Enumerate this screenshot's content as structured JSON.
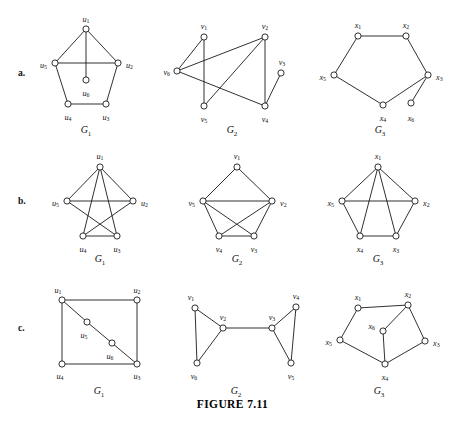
{
  "figure": {
    "caption": "FIGURE 7.11",
    "width": 465,
    "height": 421,
    "background": "#ffffff",
    "ink_color": "#1a1a1a"
  },
  "rows": [
    {
      "label": "a.",
      "label_x": 18,
      "label_y": 68
    },
    {
      "label": "b.",
      "label_x": 18,
      "label_y": 196
    },
    {
      "label": "c.",
      "label_x": 18,
      "label_y": 323
    }
  ],
  "graphs": [
    {
      "id": "a-G1",
      "row": "a.",
      "name": "G",
      "name_sub": "1",
      "name_x": 86,
      "name_y": 133,
      "vertex_radius": 3.1,
      "vertices": [
        {
          "id": "u1",
          "sym": "u",
          "sub": "1",
          "x": 86,
          "y": 29,
          "lx": 86,
          "ly": 20,
          "anchor": "middle"
        },
        {
          "id": "u2",
          "sym": "u",
          "sub": "2",
          "x": 118,
          "y": 63,
          "lx": 126,
          "ly": 66,
          "anchor": "start"
        },
        {
          "id": "u3",
          "sym": "u",
          "sub": "3",
          "x": 106,
          "y": 104,
          "lx": 106,
          "ly": 118,
          "anchor": "middle"
        },
        {
          "id": "u4",
          "sym": "u",
          "sub": "4",
          "x": 68,
          "y": 104,
          "lx": 68,
          "ly": 118,
          "anchor": "middle"
        },
        {
          "id": "u5",
          "sym": "u",
          "sub": "5",
          "x": 55,
          "y": 63,
          "lx": 47,
          "ly": 66,
          "anchor": "end"
        },
        {
          "id": "u6",
          "sym": "u",
          "sub": "6",
          "x": 86,
          "y": 80,
          "lx": 86,
          "ly": 94,
          "anchor": "middle"
        }
      ],
      "edges": [
        [
          "u1",
          "u2"
        ],
        [
          "u2",
          "u3"
        ],
        [
          "u3",
          "u4"
        ],
        [
          "u4",
          "u5"
        ],
        [
          "u5",
          "u1"
        ],
        [
          "u5",
          "u2"
        ],
        [
          "u1",
          "u6"
        ]
      ]
    },
    {
      "id": "a-G2",
      "row": "a.",
      "name": "G",
      "name_sub": "2",
      "name_x": 232,
      "name_y": 133,
      "vertex_radius": 3.1,
      "vertices": [
        {
          "id": "v1",
          "sym": "v",
          "sub": "1",
          "x": 204,
          "y": 37,
          "lx": 204,
          "ly": 27,
          "anchor": "middle"
        },
        {
          "id": "v2",
          "sym": "v",
          "sub": "2",
          "x": 265,
          "y": 37,
          "lx": 265,
          "ly": 27,
          "anchor": "middle"
        },
        {
          "id": "v3",
          "sym": "v",
          "sub": "3",
          "x": 281,
          "y": 73,
          "lx": 282,
          "ly": 63,
          "anchor": "middle"
        },
        {
          "id": "v4",
          "sym": "v",
          "sub": "4",
          "x": 265,
          "y": 106,
          "lx": 265,
          "ly": 120,
          "anchor": "middle"
        },
        {
          "id": "v5",
          "sym": "v",
          "sub": "5",
          "x": 204,
          "y": 106,
          "lx": 204,
          "ly": 120,
          "anchor": "middle"
        },
        {
          "id": "v6",
          "sym": "v",
          "sub": "6",
          "x": 177,
          "y": 71,
          "lx": 170,
          "ly": 73,
          "anchor": "end"
        }
      ],
      "edges": [
        [
          "v6",
          "v1"
        ],
        [
          "v6",
          "v2"
        ],
        [
          "v6",
          "v4"
        ],
        [
          "v1",
          "v5"
        ],
        [
          "v2",
          "v5"
        ],
        [
          "v2",
          "v4"
        ],
        [
          "v3",
          "v4"
        ]
      ]
    },
    {
      "id": "a-G3",
      "row": "a.",
      "name": "G",
      "name_sub": "3",
      "name_x": 380,
      "name_y": 133,
      "vertex_radius": 3.1,
      "vertices": [
        {
          "id": "x1",
          "sym": "x",
          "sub": "1",
          "x": 358,
          "y": 36,
          "lx": 358,
          "ly": 26,
          "anchor": "middle"
        },
        {
          "id": "x2",
          "sym": "x",
          "sub": "2",
          "x": 406,
          "y": 36,
          "lx": 406,
          "ly": 26,
          "anchor": "middle"
        },
        {
          "id": "x3",
          "sym": "x",
          "sub": "3",
          "x": 428,
          "y": 75,
          "lx": 436,
          "ly": 78,
          "anchor": "start"
        },
        {
          "id": "x4",
          "sym": "x",
          "sub": "4",
          "x": 383,
          "y": 105,
          "lx": 383,
          "ly": 119,
          "anchor": "middle"
        },
        {
          "id": "x5",
          "sym": "x",
          "sub": "5",
          "x": 334,
          "y": 75,
          "lx": 326,
          "ly": 78,
          "anchor": "end"
        },
        {
          "id": "x6",
          "sym": "x",
          "sub": "6",
          "x": 411,
          "y": 103,
          "lx": 411,
          "ly": 119,
          "anchor": "middle"
        }
      ],
      "edges": [
        [
          "x1",
          "x2"
        ],
        [
          "x2",
          "x3"
        ],
        [
          "x3",
          "x4"
        ],
        [
          "x4",
          "x5"
        ],
        [
          "x5",
          "x1"
        ],
        [
          "x3",
          "x6"
        ]
      ]
    },
    {
      "id": "b-G1",
      "row": "b.",
      "name": "G",
      "name_sub": "1",
      "name_x": 100,
      "name_y": 262,
      "vertex_radius": 3.1,
      "vertices": [
        {
          "id": "u1",
          "sym": "u",
          "sub": "1",
          "x": 100,
          "y": 167,
          "lx": 100,
          "ly": 157,
          "anchor": "middle"
        },
        {
          "id": "u2",
          "sym": "u",
          "sub": "2",
          "x": 133,
          "y": 201,
          "lx": 141,
          "ly": 204,
          "anchor": "start"
        },
        {
          "id": "u3",
          "sym": "u",
          "sub": "3",
          "x": 117,
          "y": 236,
          "lx": 117,
          "ly": 250,
          "anchor": "middle"
        },
        {
          "id": "u4",
          "sym": "u",
          "sub": "4",
          "x": 83,
          "y": 236,
          "lx": 83,
          "ly": 250,
          "anchor": "middle"
        },
        {
          "id": "u5",
          "sym": "u",
          "sub": "5",
          "x": 67,
          "y": 201,
          "lx": 59,
          "ly": 204,
          "anchor": "end"
        }
      ],
      "edges": [
        [
          "u1",
          "u5"
        ],
        [
          "u1",
          "u2"
        ],
        [
          "u1",
          "u4"
        ],
        [
          "u1",
          "u3"
        ],
        [
          "u5",
          "u2"
        ],
        [
          "u5",
          "u3"
        ],
        [
          "u2",
          "u4"
        ],
        [
          "u4",
          "u3"
        ]
      ]
    },
    {
      "id": "b-G2",
      "row": "b.",
      "name": "G",
      "name_sub": "2",
      "name_x": 237,
      "name_y": 262,
      "vertex_radius": 3.1,
      "vertices": [
        {
          "id": "v1",
          "sym": "v",
          "sub": "1",
          "x": 237,
          "y": 167,
          "lx": 237,
          "ly": 157,
          "anchor": "middle"
        },
        {
          "id": "v2",
          "sym": "v",
          "sub": "2",
          "x": 272,
          "y": 201,
          "lx": 280,
          "ly": 204,
          "anchor": "start"
        },
        {
          "id": "v3",
          "sym": "v",
          "sub": "3",
          "x": 254,
          "y": 236,
          "lx": 254,
          "ly": 250,
          "anchor": "middle"
        },
        {
          "id": "v4",
          "sym": "v",
          "sub": "4",
          "x": 219,
          "y": 236,
          "lx": 219,
          "ly": 250,
          "anchor": "middle"
        },
        {
          "id": "v5",
          "sym": "v",
          "sub": "5",
          "x": 203,
          "y": 201,
          "lx": 195,
          "ly": 204,
          "anchor": "end"
        }
      ],
      "edges": [
        [
          "v1",
          "v5"
        ],
        [
          "v1",
          "v2"
        ],
        [
          "v5",
          "v2"
        ],
        [
          "v5",
          "v4"
        ],
        [
          "v5",
          "v3"
        ],
        [
          "v2",
          "v4"
        ],
        [
          "v2",
          "v3"
        ],
        [
          "v4",
          "v3"
        ]
      ]
    },
    {
      "id": "b-G3",
      "row": "b.",
      "name": "G",
      "name_sub": "3",
      "name_x": 378,
      "name_y": 262,
      "vertex_radius": 3.1,
      "vertices": [
        {
          "id": "x1",
          "sym": "x",
          "sub": "1",
          "x": 378,
          "y": 167,
          "lx": 378,
          "ly": 157,
          "anchor": "middle"
        },
        {
          "id": "x2",
          "sym": "x",
          "sub": "2",
          "x": 415,
          "y": 201,
          "lx": 423,
          "ly": 204,
          "anchor": "start"
        },
        {
          "id": "x3",
          "sym": "x",
          "sub": "3",
          "x": 396,
          "y": 236,
          "lx": 396,
          "ly": 250,
          "anchor": "middle"
        },
        {
          "id": "x4",
          "sym": "x",
          "sub": "4",
          "x": 360,
          "y": 236,
          "lx": 360,
          "ly": 250,
          "anchor": "middle"
        },
        {
          "id": "x5",
          "sym": "x",
          "sub": "5",
          "x": 342,
          "y": 201,
          "lx": 334,
          "ly": 204,
          "anchor": "end"
        }
      ],
      "edges": [
        [
          "x1",
          "x5"
        ],
        [
          "x1",
          "x2"
        ],
        [
          "x1",
          "x4"
        ],
        [
          "x1",
          "x3"
        ],
        [
          "x5",
          "x2"
        ],
        [
          "x5",
          "x4"
        ],
        [
          "x2",
          "x3"
        ],
        [
          "x4",
          "x3"
        ]
      ]
    },
    {
      "id": "c-G1",
      "row": "c.",
      "name": "G",
      "name_sub": "1",
      "name_x": 99,
      "name_y": 394,
      "vertex_radius": 3.1,
      "vertices": [
        {
          "id": "u1",
          "sym": "u",
          "sub": "1",
          "x": 62,
          "y": 300,
          "lx": 58,
          "ly": 291,
          "anchor": "middle"
        },
        {
          "id": "u2",
          "sym": "u",
          "sub": "2",
          "x": 137,
          "y": 300,
          "lx": 137,
          "ly": 291,
          "anchor": "middle"
        },
        {
          "id": "u3",
          "sym": "u",
          "sub": "3",
          "x": 137,
          "y": 364,
          "lx": 137,
          "ly": 377,
          "anchor": "middle"
        },
        {
          "id": "u4",
          "sym": "u",
          "sub": "4",
          "x": 62,
          "y": 364,
          "lx": 60,
          "ly": 377,
          "anchor": "middle"
        },
        {
          "id": "u5",
          "sym": "u",
          "sub": "5",
          "x": 87,
          "y": 322,
          "lx": 84,
          "ly": 336,
          "anchor": "middle"
        },
        {
          "id": "u6",
          "sym": "u",
          "sub": "6",
          "x": 112,
          "y": 343,
          "lx": 110,
          "ly": 357,
          "anchor": "middle"
        }
      ],
      "edges": [
        [
          "u1",
          "u2"
        ],
        [
          "u2",
          "u3"
        ],
        [
          "u3",
          "u4"
        ],
        [
          "u4",
          "u1"
        ],
        [
          "u1",
          "u5"
        ],
        [
          "u5",
          "u6"
        ],
        [
          "u6",
          "u3"
        ]
      ]
    },
    {
      "id": "c-G2",
      "row": "c.",
      "name": "G",
      "name_sub": "2",
      "name_x": 236,
      "name_y": 394,
      "vertex_radius": 3.1,
      "vertices": [
        {
          "id": "v1",
          "sym": "v",
          "sub": "1",
          "x": 195,
          "y": 308,
          "lx": 191,
          "ly": 298,
          "anchor": "middle"
        },
        {
          "id": "v2",
          "sym": "v",
          "sub": "2",
          "x": 223,
          "y": 328,
          "lx": 223,
          "ly": 318,
          "anchor": "middle"
        },
        {
          "id": "v3",
          "sym": "v",
          "sub": "3",
          "x": 272,
          "y": 328,
          "lx": 272,
          "ly": 318,
          "anchor": "middle"
        },
        {
          "id": "v4",
          "sym": "v",
          "sub": "4",
          "x": 296,
          "y": 307,
          "lx": 296,
          "ly": 297,
          "anchor": "middle"
        },
        {
          "id": "v5",
          "sym": "v",
          "sub": "5",
          "x": 291,
          "y": 363,
          "lx": 291,
          "ly": 377,
          "anchor": "middle"
        },
        {
          "id": "v6",
          "sym": "v",
          "sub": "6",
          "x": 197,
          "y": 363,
          "lx": 194,
          "ly": 377,
          "anchor": "middle"
        }
      ],
      "edges": [
        [
          "v1",
          "v2"
        ],
        [
          "v1",
          "v6"
        ],
        [
          "v2",
          "v6"
        ],
        [
          "v2",
          "v3"
        ],
        [
          "v3",
          "v4"
        ],
        [
          "v3",
          "v5"
        ],
        [
          "v4",
          "v5"
        ]
      ]
    },
    {
      "id": "c-G3",
      "row": "c.",
      "name": "G",
      "name_sub": "3",
      "name_x": 379,
      "name_y": 394,
      "vertex_radius": 3.1,
      "vertices": [
        {
          "id": "x1",
          "sym": "x",
          "sub": "1",
          "x": 358,
          "y": 308,
          "lx": 358,
          "ly": 298,
          "anchor": "middle"
        },
        {
          "id": "x2",
          "sym": "x",
          "sub": "2",
          "x": 408,
          "y": 305,
          "lx": 408,
          "ly": 295,
          "anchor": "middle"
        },
        {
          "id": "x3",
          "sym": "x",
          "sub": "3",
          "x": 425,
          "y": 341,
          "lx": 433,
          "ly": 344,
          "anchor": "start"
        },
        {
          "id": "x4",
          "sym": "x",
          "sub": "4",
          "x": 385,
          "y": 364,
          "lx": 385,
          "ly": 378,
          "anchor": "middle"
        },
        {
          "id": "x5",
          "sym": "x",
          "sub": "5",
          "x": 340,
          "y": 340,
          "lx": 332,
          "ly": 343,
          "anchor": "end"
        },
        {
          "id": "x6",
          "sym": "x",
          "sub": "6",
          "x": 383,
          "y": 331,
          "lx": 375,
          "ly": 327,
          "anchor": "end"
        }
      ],
      "edges": [
        [
          "x1",
          "x2"
        ],
        [
          "x2",
          "x3"
        ],
        [
          "x3",
          "x4"
        ],
        [
          "x4",
          "x5"
        ],
        [
          "x5",
          "x1"
        ],
        [
          "x6",
          "x2"
        ],
        [
          "x6",
          "x4"
        ]
      ]
    }
  ]
}
